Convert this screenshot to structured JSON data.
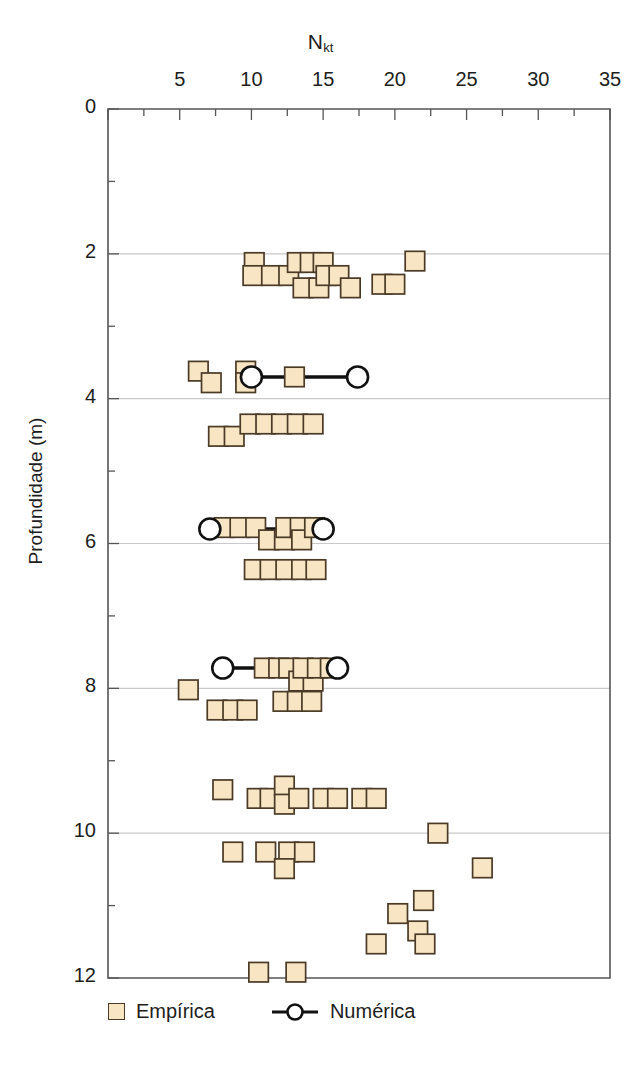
{
  "chart_data": {
    "type": "scatter",
    "title": "",
    "xlabel": "N_kt",
    "xlabel_base": "N",
    "xlabel_sub": "kt",
    "ylabel": "Profundidade (m)",
    "xlim": [
      0,
      35
    ],
    "ylim": [
      0,
      12
    ],
    "y_inverted": true,
    "xticks": [
      0,
      5,
      10,
      15,
      20,
      25,
      30,
      35
    ],
    "xtick_labels": [
      "",
      "5",
      "10",
      "15",
      "20",
      "25",
      "30",
      "35"
    ],
    "x_minor_tick_step": 2.5,
    "yticks": [
      0,
      2,
      4,
      6,
      8,
      10,
      12
    ],
    "ytick_labels": [
      "0",
      "2",
      "4",
      "6",
      "8",
      "10",
      "12"
    ],
    "y_minor_tick_step": 1,
    "grid": "horizontal",
    "gridlines_y": [
      2,
      4,
      6,
      8,
      10
    ],
    "legend_position": "below-axes",
    "colors": {
      "marker_fill": "#f7e5c3",
      "marker_edge": "#4a3a26",
      "numeric_line": "#111111",
      "circle_fill": "#ffffff",
      "circle_edge": "#111111",
      "grid": "#c9c9c9",
      "axis": "#555555"
    },
    "series": [
      {
        "name": "Empírica",
        "marker": "square",
        "points": [
          [
            10.2,
            2.12
          ],
          [
            10.1,
            2.3
          ],
          [
            11.4,
            2.3
          ],
          [
            12.6,
            2.3
          ],
          [
            13.2,
            2.12
          ],
          [
            14.1,
            2.12
          ],
          [
            13.6,
            2.47
          ],
          [
            14.7,
            2.47
          ],
          [
            15.0,
            2.12
          ],
          [
            15.2,
            2.3
          ],
          [
            16.1,
            2.3
          ],
          [
            16.9,
            2.47
          ],
          [
            19.1,
            2.42
          ],
          [
            20.0,
            2.42
          ],
          [
            21.4,
            2.1
          ],
          [
            6.3,
            3.62
          ],
          [
            7.2,
            3.78
          ],
          [
            9.6,
            3.62
          ],
          [
            9.6,
            3.78
          ],
          [
            13.0,
            3.7
          ],
          [
            7.7,
            4.52
          ],
          [
            8.8,
            4.52
          ],
          [
            9.9,
            4.35
          ],
          [
            11.0,
            4.35
          ],
          [
            12.1,
            4.35
          ],
          [
            13.2,
            4.35
          ],
          [
            14.3,
            4.35
          ],
          [
            8.1,
            5.78
          ],
          [
            9.2,
            5.78
          ],
          [
            10.3,
            5.78
          ],
          [
            11.2,
            5.95
          ],
          [
            12.3,
            5.95
          ],
          [
            12.4,
            5.78
          ],
          [
            13.4,
            5.78
          ],
          [
            13.5,
            5.95
          ],
          [
            14.4,
            5.78
          ],
          [
            10.2,
            6.36
          ],
          [
            11.3,
            6.36
          ],
          [
            12.4,
            6.36
          ],
          [
            13.5,
            6.36
          ],
          [
            14.5,
            6.36
          ],
          [
            5.6,
            8.02
          ],
          [
            7.6,
            8.3
          ],
          [
            8.7,
            8.3
          ],
          [
            9.7,
            8.3
          ],
          [
            10.9,
            7.72
          ],
          [
            11.9,
            7.72
          ],
          [
            12.6,
            7.72
          ],
          [
            13.3,
            7.9
          ],
          [
            14.3,
            7.9
          ],
          [
            13.6,
            7.72
          ],
          [
            14.6,
            7.72
          ],
          [
            15.5,
            7.72
          ],
          [
            12.2,
            8.18
          ],
          [
            13.2,
            8.18
          ],
          [
            14.2,
            8.18
          ],
          [
            8.0,
            9.4
          ],
          [
            10.4,
            9.52
          ],
          [
            11.3,
            9.52
          ],
          [
            12.3,
            9.35
          ],
          [
            12.3,
            9.6
          ],
          [
            13.3,
            9.52
          ],
          [
            15.0,
            9.52
          ],
          [
            16.0,
            9.52
          ],
          [
            17.7,
            9.52
          ],
          [
            18.7,
            9.52
          ],
          [
            23.0,
            10.0
          ],
          [
            8.7,
            10.26
          ],
          [
            11.0,
            10.26
          ],
          [
            12.6,
            10.26
          ],
          [
            13.7,
            10.26
          ],
          [
            12.3,
            10.49
          ],
          [
            26.1,
            10.48
          ],
          [
            22.0,
            10.93
          ],
          [
            20.2,
            11.11
          ],
          [
            21.6,
            11.35
          ],
          [
            18.7,
            11.53
          ],
          [
            22.1,
            11.53
          ],
          [
            10.5,
            11.92
          ],
          [
            13.1,
            11.92
          ]
        ]
      },
      {
        "name": "Numérica",
        "marker": "circle-line",
        "segments": [
          {
            "depth": 3.7,
            "x_start": 10.0,
            "x_end": 17.4
          },
          {
            "depth": 5.8,
            "x_start": 7.1,
            "x_end": 15.0
          },
          {
            "depth": 7.72,
            "x_start": 8.0,
            "x_end": 16.0
          }
        ]
      }
    ]
  },
  "legend": {
    "entries": [
      {
        "label": "Empírica",
        "marker": "square"
      },
      {
        "label": "Numérica",
        "marker": "circle-line"
      }
    ]
  }
}
